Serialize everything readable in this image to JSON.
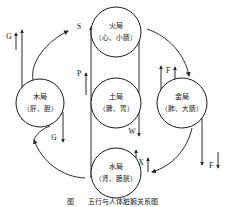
{
  "figure": {
    "caption": "图　　五行与人体脏腑关系图",
    "width": 225,
    "height": 207
  },
  "colors": {
    "stroke": "#2b2b2b",
    "node_stroke": "#1a1a1a",
    "background": "#ffffff",
    "text": "#111111"
  },
  "nodes": [
    {
      "id": "fire",
      "element": "火局",
      "organs": "（心、小肠）",
      "cx": 116,
      "cy": 32,
      "r": 25,
      "position": "top"
    },
    {
      "id": "wood",
      "element": "木局",
      "organs": "（肝、胆）",
      "cx": 40,
      "cy": 103,
      "r": 24,
      "position": "left"
    },
    {
      "id": "earth",
      "element": "土局",
      "organs": "（脾、胃）",
      "cx": 116,
      "cy": 103,
      "r": 25,
      "position": "center"
    },
    {
      "id": "metal",
      "element": "金局",
      "organs": "（肺、大肠）",
      "cx": 182,
      "cy": 103,
      "r": 25,
      "position": "right"
    },
    {
      "id": "water",
      "element": "水局",
      "organs": "（肾、膀胱）",
      "cx": 116,
      "cy": 173,
      "r": 25,
      "position": "bottom"
    }
  ],
  "markers": [
    {
      "id": "g-up",
      "label": "G",
      "x": 9,
      "y": 37,
      "direction": "up",
      "note": "left outer ascending"
    },
    {
      "id": "g-down",
      "label": "G",
      "x": 54,
      "y": 138,
      "direction": "down",
      "note": "wood descending"
    },
    {
      "id": "s-mark",
      "label": "S",
      "x": 79,
      "y": 27,
      "direction": "up",
      "note": "fire inflow"
    },
    {
      "id": "p-mark",
      "label": "P",
      "x": 79,
      "y": 74,
      "direction": "up",
      "note": "earth to fire"
    },
    {
      "id": "f-up",
      "label": "F",
      "x": 168,
      "y": 71,
      "direction": "up",
      "note": "metal ascending"
    },
    {
      "id": "f-down",
      "label": "F",
      "x": 211,
      "y": 166,
      "direction": "down",
      "note": "right outer descending"
    },
    {
      "id": "w-mark",
      "label": "W",
      "x": 138,
      "y": 132,
      "direction": "down",
      "note": "fire to water"
    },
    {
      "id": "x-mark",
      "label": "X",
      "x": 141,
      "y": 163,
      "direction": "up",
      "note": "water ascending"
    }
  ],
  "legend": {
    "G": "木",
    "S": "生",
    "P": "脾",
    "F": "肺",
    "W": "水",
    "X": "相"
  }
}
